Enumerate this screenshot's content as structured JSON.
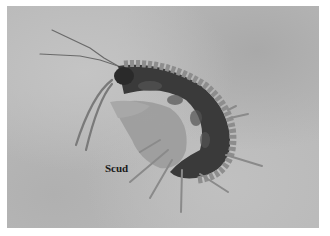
{
  "image": {
    "subject": "scud (freshwater amphipod) photographed on gray background",
    "label": "Scud",
    "colors": {
      "background": "#b9b9b9",
      "border": "#ffffff",
      "body_dark": "#2e2e2e",
      "body_light": "#8a8a8a",
      "label": "#1a1a1a"
    }
  }
}
